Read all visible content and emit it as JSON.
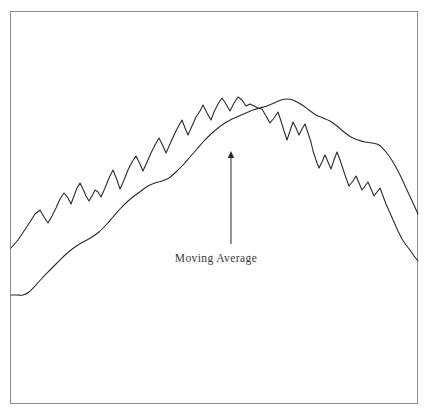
{
  "figure": {
    "background_color": "#ffffff",
    "frame": {
      "border_color": "#8c8c8c",
      "x": 10,
      "y": 11,
      "width": 408,
      "height": 393
    }
  },
  "annotation": {
    "label": "Moving Average",
    "label_color": "#3a3a3a",
    "arrow": {
      "name": "moving-average-pointer",
      "x": 231,
      "tip_y": 151,
      "tail_y": 244,
      "color": "#2b2b2b"
    }
  },
  "chart_data": {
    "type": "line",
    "title": "",
    "subtitle": "",
    "xlabel": "",
    "ylabel": "",
    "grid": false,
    "legend": "none",
    "annotations": [
      {
        "text": "Moving Average",
        "points_to_series": "Moving Average",
        "arrow_from": [
          231,
          244
        ],
        "arrow_to": [
          231,
          151
        ]
      }
    ],
    "axis_note": "Unlabeled axes; values expressed in screen pixel coordinates of the plot frame (y increases downward).",
    "xlim": [
      11,
      418
    ],
    "ylim": [
      404,
      12
    ],
    "series": [
      {
        "name": "Price",
        "role": "noisy-price-series",
        "color": "#2b2b2b",
        "stroke_width": 1.1,
        "smooth": false,
        "points": [
          [
            11,
            248
          ],
          [
            18,
            240
          ],
          [
            24,
            231
          ],
          [
            30,
            222
          ],
          [
            35,
            214
          ],
          [
            40,
            210
          ],
          [
            44,
            217
          ],
          [
            48,
            223
          ],
          [
            52,
            216
          ],
          [
            56,
            208
          ],
          [
            60,
            199
          ],
          [
            64,
            193
          ],
          [
            68,
            198
          ],
          [
            71,
            204
          ],
          [
            74,
            196
          ],
          [
            77,
            188
          ],
          [
            80,
            183
          ],
          [
            83,
            189
          ],
          [
            86,
            196
          ],
          [
            89,
            201
          ],
          [
            92,
            196
          ],
          [
            95,
            190
          ],
          [
            98,
            192
          ],
          [
            101,
            197
          ],
          [
            105,
            188
          ],
          [
            109,
            178
          ],
          [
            113,
            170
          ],
          [
            117,
            180
          ],
          [
            120,
            189
          ],
          [
            124,
            180
          ],
          [
            128,
            170
          ],
          [
            132,
            162
          ],
          [
            136,
            156
          ],
          [
            140,
            164
          ],
          [
            143,
            171
          ],
          [
            147,
            162
          ],
          [
            151,
            153
          ],
          [
            155,
            145
          ],
          [
            159,
            138
          ],
          [
            163,
            146
          ],
          [
            166,
            153
          ],
          [
            170,
            144
          ],
          [
            174,
            135
          ],
          [
            178,
            127
          ],
          [
            182,
            120
          ],
          [
            185,
            128
          ],
          [
            188,
            135
          ],
          [
            192,
            126
          ],
          [
            196,
            117
          ],
          [
            200,
            111
          ],
          [
            203,
            105
          ],
          [
            207,
            113
          ],
          [
            211,
            120
          ],
          [
            214,
            112
          ],
          [
            218,
            104
          ],
          [
            222,
            98
          ],
          [
            226,
            104
          ],
          [
            230,
            111
          ],
          [
            234,
            103
          ],
          [
            238,
            97
          ],
          [
            242,
            100
          ],
          [
            246,
            106
          ],
          [
            250,
            104
          ],
          [
            254,
            106
          ],
          [
            258,
            108
          ],
          [
            262,
            109
          ],
          [
            266,
            116
          ],
          [
            270,
            123
          ],
          [
            274,
            118
          ],
          [
            278,
            112
          ],
          [
            281,
            121
          ],
          [
            284,
            131
          ],
          [
            287,
            140
          ],
          [
            290,
            131
          ],
          [
            293,
            122
          ],
          [
            296,
            128
          ],
          [
            299,
            135
          ],
          [
            302,
            129
          ],
          [
            305,
            124
          ],
          [
            308,
            133
          ],
          [
            311,
            142
          ],
          [
            313,
            151
          ],
          [
            316,
            160
          ],
          [
            319,
            168
          ],
          [
            322,
            162
          ],
          [
            325,
            155
          ],
          [
            328,
            162
          ],
          [
            331,
            169
          ],
          [
            334,
            160
          ],
          [
            337,
            152
          ],
          [
            340,
            160
          ],
          [
            343,
            169
          ],
          [
            346,
            178
          ],
          [
            349,
            186
          ],
          [
            353,
            181
          ],
          [
            356,
            176
          ],
          [
            359,
            183
          ],
          [
            362,
            190
          ],
          [
            365,
            186
          ],
          [
            368,
            182
          ],
          [
            371,
            189
          ],
          [
            374,
            196
          ],
          [
            377,
            192
          ],
          [
            380,
            188
          ],
          [
            383,
            196
          ],
          [
            386,
            204
          ],
          [
            390,
            213
          ],
          [
            394,
            222
          ],
          [
            398,
            231
          ],
          [
            402,
            239
          ],
          [
            406,
            245
          ],
          [
            410,
            250
          ],
          [
            414,
            256
          ],
          [
            418,
            261
          ]
        ]
      },
      {
        "name": "Moving Average",
        "role": "smoothed-trend-series",
        "color": "#2b2b2b",
        "stroke_width": 1.1,
        "smooth": true,
        "points": [
          [
            11,
            295
          ],
          [
            17,
            295
          ],
          [
            23,
            295
          ],
          [
            29,
            292
          ],
          [
            36,
            285
          ],
          [
            43,
            277
          ],
          [
            50,
            270
          ],
          [
            57,
            263
          ],
          [
            64,
            256
          ],
          [
            71,
            250
          ],
          [
            78,
            245
          ],
          [
            85,
            241
          ],
          [
            92,
            237
          ],
          [
            99,
            232
          ],
          [
            106,
            225
          ],
          [
            113,
            217
          ],
          [
            120,
            209
          ],
          [
            127,
            202
          ],
          [
            134,
            196
          ],
          [
            141,
            191
          ],
          [
            148,
            186
          ],
          [
            155,
            183
          ],
          [
            162,
            181
          ],
          [
            169,
            178
          ],
          [
            176,
            172
          ],
          [
            183,
            165
          ],
          [
            190,
            157
          ],
          [
            197,
            149
          ],
          [
            204,
            141
          ],
          [
            211,
            134
          ],
          [
            218,
            128
          ],
          [
            225,
            123
          ],
          [
            232,
            119
          ],
          [
            239,
            116
          ],
          [
            246,
            113
          ],
          [
            253,
            110
          ],
          [
            260,
            108
          ],
          [
            267,
            106
          ],
          [
            274,
            103
          ],
          [
            281,
            100
          ],
          [
            288,
            99
          ],
          [
            295,
            101
          ],
          [
            302,
            105
          ],
          [
            309,
            110
          ],
          [
            316,
            115
          ],
          [
            323,
            118
          ],
          [
            330,
            121
          ],
          [
            337,
            126
          ],
          [
            344,
            132
          ],
          [
            351,
            137
          ],
          [
            358,
            140
          ],
          [
            365,
            142
          ],
          [
            372,
            143
          ],
          [
            379,
            145
          ],
          [
            386,
            152
          ],
          [
            393,
            162
          ],
          [
            400,
            175
          ],
          [
            407,
            190
          ],
          [
            413,
            203
          ],
          [
            418,
            214
          ]
        ]
      }
    ]
  }
}
